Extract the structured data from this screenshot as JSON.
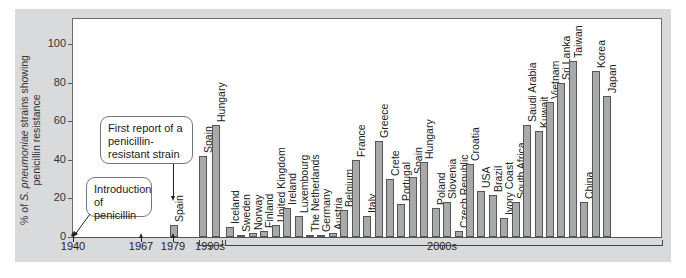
{
  "chart_data": {
    "type": "bar",
    "title": "",
    "xlabel": "",
    "ylabel": "% of S. pneumoniae strains showing penicillin resistance",
    "ylim": [
      0,
      100
    ],
    "yticks": [
      0,
      20,
      40,
      60,
      80,
      100
    ],
    "grid": false,
    "legend": null,
    "timeline_ticks": [
      "1940",
      "1967",
      "1979",
      "1990s",
      "2000s"
    ],
    "annotations": [
      {
        "text": "Introduction of penicillin",
        "points_to": "1940"
      },
      {
        "text": "First report of a penicillin-resistant strain",
        "points_to": "1979"
      }
    ],
    "groups": [
      {
        "period": "1979",
        "categories": [
          "Spain"
        ],
        "values": [
          6
        ]
      },
      {
        "period": "1990s",
        "categories": [
          "Spain",
          "Hungary"
        ],
        "values": [
          42,
          58
        ]
      },
      {
        "period": "2000s",
        "categories": [
          "Iceland",
          "Sweden",
          "Norway",
          "Finland",
          "United Kingdom",
          "Ireland",
          "Luxembourg",
          "The Netherlands",
          "Germany",
          "Austria",
          "Belgium",
          "France",
          "Italy",
          "Greece",
          "Crete",
          "Portugal",
          "Spain",
          "Hungary",
          "Poland",
          "Slovenia",
          "Czech Republic",
          "Croatia",
          "USA",
          "Brazil",
          "Ivory Coast",
          "South Africa",
          "Saudi Arabia",
          "Kuwait",
          "Vietnam",
          "Sri Lanka",
          "Taiwan",
          "China",
          "Korea",
          "Japan"
        ],
        "values": [
          5,
          1,
          2,
          3,
          6,
          15,
          11,
          1,
          1,
          2,
          14,
          40,
          11,
          50,
          30,
          17,
          31,
          39,
          15,
          18,
          3,
          38,
          24,
          22,
          10,
          18,
          58,
          55,
          70,
          80,
          91,
          18,
          86,
          73
        ]
      }
    ]
  },
  "yaxis": {
    "label_prefix": "% of ",
    "label_species": "S. pneumoniae",
    "label_line1_suffix": " strains showing",
    "label_line2": "penicillin resistance",
    "ticks": [
      "0",
      "20",
      "40",
      "60",
      "80",
      "100"
    ]
  },
  "xaxis": {
    "tick_1940": "1940",
    "tick_1967": "1967",
    "tick_1979": "1979",
    "period_1990s": "1990s",
    "period_2000s": "2000s"
  },
  "callouts": {
    "penicillin_intro": "Introduction of penicillin",
    "first_resistant": "First report of a penicillin-resistant strain"
  },
  "colors": {
    "bar_fill": "#a8a9ab",
    "bar_border": "#555555",
    "panel_bg": "#d9dadb",
    "plot_bg": "#ffffff"
  }
}
